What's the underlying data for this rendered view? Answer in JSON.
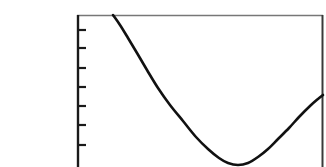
{
  "label": {
    "number": "21.",
    "part": "c."
  },
  "annotation": {
    "text": "s→0⁺"
  },
  "chart_data": {
    "type": "line",
    "title": "",
    "xlabel": "",
    "ylabel": "",
    "grid": false,
    "legend": null,
    "axis_frame": {
      "left_px": 77,
      "top_px": 15,
      "right_px": 323,
      "bottom_clipped": true
    },
    "y_axis_ticks": {
      "count": 7,
      "labels": [
        "",
        "",
        "",
        "",
        "",
        "",
        ""
      ],
      "positions_px": [
        30,
        48,
        68,
        87,
        106,
        125,
        145
      ],
      "side": "left",
      "tick_length_px": 7
    },
    "x_axis_ticks": {
      "count": 0,
      "labels": []
    },
    "curve_points": [
      {
        "x": 113,
        "y": 15
      },
      {
        "x": 120,
        "y": 25
      },
      {
        "x": 128,
        "y": 38
      },
      {
        "x": 137,
        "y": 53
      },
      {
        "x": 147,
        "y": 70
      },
      {
        "x": 158,
        "y": 88
      },
      {
        "x": 170,
        "y": 105
      },
      {
        "x": 183,
        "y": 121
      },
      {
        "x": 196,
        "y": 137
      },
      {
        "x": 208,
        "y": 149
      },
      {
        "x": 219,
        "y": 158
      },
      {
        "x": 228,
        "y": 163
      },
      {
        "x": 238,
        "y": 165
      },
      {
        "x": 248,
        "y": 163
      },
      {
        "x": 258,
        "y": 157
      },
      {
        "x": 268,
        "y": 149
      },
      {
        "x": 278,
        "y": 139
      },
      {
        "x": 289,
        "y": 128
      },
      {
        "x": 299,
        "y": 117
      },
      {
        "x": 310,
        "y": 106
      },
      {
        "x": 318,
        "y": 99
      },
      {
        "x": 323,
        "y": 95
      }
    ],
    "minimum_point": {
      "x": 238,
      "y": 165
    },
    "colors": {
      "curve": "#111111",
      "frame": "#777777",
      "axis": "#1a1a1a",
      "background": "#ffffff"
    }
  }
}
